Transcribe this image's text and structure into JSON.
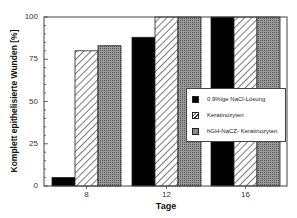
{
  "chart_data": {
    "type": "bar",
    "title": "",
    "xlabel": "Tage",
    "ylabel": "Komplett epithelisierte Wunden [%]",
    "categories": [
      "8",
      "12",
      "16"
    ],
    "series": [
      {
        "name": "0,9%ige NaCl-Lösung",
        "values": [
          5,
          88,
          100
        ],
        "pattern": "solid-black"
      },
      {
        "name": "Keratinozyten",
        "values": [
          80,
          100,
          100
        ],
        "pattern": "diagonal-hatch"
      },
      {
        "name": "hGH-NaCZ- Keratinozyten",
        "values": [
          83,
          100,
          100
        ],
        "pattern": "gray-stipple"
      }
    ],
    "ylim": [
      0,
      100
    ],
    "yticks": [
      0,
      25,
      50,
      75,
      100
    ],
    "grid": false,
    "legend_position": "inside-right"
  },
  "colors": {
    "series_0": "#000000",
    "series_1": "#ffffff",
    "series_2": "#8a8a8a",
    "axis": "#444444"
  },
  "labels": {
    "xlabel": "Tage",
    "ylabel": "Komplett epithelisierte Wunden [%]",
    "yticks": [
      "0",
      "25",
      "50",
      "75",
      "100"
    ],
    "xticks": [
      "8",
      "12",
      "16"
    ],
    "legend": [
      "0,9%ige NaCl-Lösung",
      "Keratinozyten",
      "hGH-NaCZ- Keratinozyten"
    ]
  }
}
